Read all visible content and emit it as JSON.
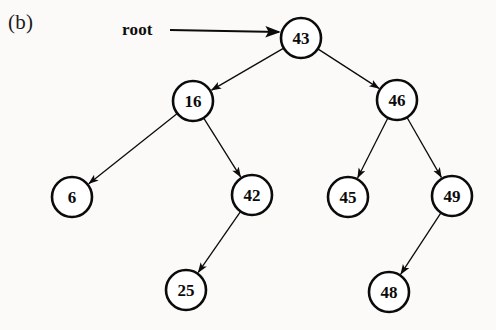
{
  "figure": {
    "panel_label": "(b)",
    "root_pointer_label": "root",
    "background_color": "#fbfaf8",
    "stroke_color": "#0b0b0b"
  },
  "chart_data": {
    "type": "diagram",
    "title": "(b)",
    "diagram_kind": "binary-search-tree",
    "nodes": [
      {
        "id": "n43",
        "label": "43",
        "x": 301,
        "y": 38,
        "r": 20,
        "level": 0
      },
      {
        "id": "n16",
        "label": "16",
        "x": 193,
        "y": 101,
        "r": 20,
        "level": 1
      },
      {
        "id": "n46",
        "label": "46",
        "x": 397,
        "y": 100,
        "r": 20,
        "level": 1
      },
      {
        "id": "n6",
        "label": "6",
        "x": 72,
        "y": 197,
        "r": 20,
        "level": 2
      },
      {
        "id": "n42",
        "label": "42",
        "x": 252,
        "y": 195,
        "r": 20,
        "level": 2
      },
      {
        "id": "n45",
        "label": "45",
        "x": 348,
        "y": 197,
        "r": 20,
        "level": 2
      },
      {
        "id": "n49",
        "label": "49",
        "x": 452,
        "y": 196,
        "r": 20,
        "level": 2
      },
      {
        "id": "n25",
        "label": "25",
        "x": 186,
        "y": 290,
        "r": 20,
        "level": 3
      },
      {
        "id": "n48",
        "label": "48",
        "x": 389,
        "y": 292,
        "r": 20,
        "level": 3
      }
    ],
    "edges": [
      {
        "from": "n43",
        "to": "n16",
        "side": "left",
        "arrow": true
      },
      {
        "from": "n43",
        "to": "n46",
        "side": "right",
        "arrow": true
      },
      {
        "from": "n16",
        "to": "n6",
        "side": "left",
        "arrow": true
      },
      {
        "from": "n16",
        "to": "n42",
        "side": "right",
        "arrow": true
      },
      {
        "from": "n42",
        "to": "n25",
        "side": "left",
        "arrow": true
      },
      {
        "from": "n46",
        "to": "n45",
        "side": "left",
        "arrow": true
      },
      {
        "from": "n46",
        "to": "n49",
        "side": "right",
        "arrow": true
      },
      {
        "from": "n49",
        "to": "n48",
        "side": "left",
        "arrow": true
      }
    ],
    "root_pointer": {
      "label": "root",
      "label_x": 122,
      "label_y": 22,
      "line_x1": 170,
      "line_y1": 30,
      "line_x2": 279,
      "line_y2": 32
    },
    "traversals": {
      "inorder": [
        "6",
        "16",
        "25",
        "42",
        "43",
        "45",
        "46",
        "48",
        "49"
      ],
      "preorder": [
        "43",
        "16",
        "6",
        "42",
        "25",
        "46",
        "45",
        "49",
        "48"
      ]
    }
  }
}
